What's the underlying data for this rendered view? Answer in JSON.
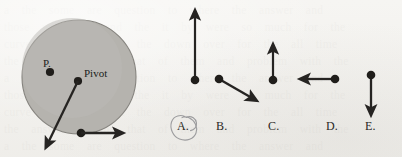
{
  "figure": {
    "type": "physics-rotating-disk-diagram",
    "background_color": "#f2f1ee",
    "ink_color": "#262422",
    "disk": {
      "label_pivot": "Pivot",
      "label_point_p": "P.",
      "fill_color": "#b5b3ae",
      "stroke_color": "#7e7c77",
      "center_x": 79,
      "center_y": 77,
      "radius": 57
    },
    "vectors": [
      {
        "name": "rim-velocity-arrow",
        "from_x": 81,
        "from_y": 133,
        "to_x": 122,
        "to_y": 133,
        "has_dot": true
      },
      {
        "name": "pivot-diagonal-arrow",
        "from_x": 78,
        "from_y": 81,
        "to_x": 47,
        "to_y": 146,
        "has_dot": true
      }
    ]
  },
  "options": [
    {
      "letter": "A.",
      "direction": "up",
      "circled": true,
      "dot_x": 195,
      "dot_y": 80,
      "tip_x": 195,
      "tip_y": 11,
      "label_x": 177,
      "label_y": 126
    },
    {
      "letter": "B.",
      "direction": "down-right",
      "circled": false,
      "dot_x": 219,
      "dot_y": 79,
      "tip_x": 256,
      "tip_y": 100,
      "label_x": 217,
      "label_y": 126
    },
    {
      "letter": "C.",
      "direction": "up",
      "circled": false,
      "dot_x": 273,
      "dot_y": 80,
      "tip_x": 273,
      "tip_y": 45,
      "label_x": 269,
      "label_y": 126
    },
    {
      "letter": "D.",
      "direction": "left",
      "circled": false,
      "dot_x": 335,
      "dot_y": 79,
      "tip_x": 300,
      "tip_y": 79,
      "label_x": 327,
      "label_y": 126
    },
    {
      "letter": "E.",
      "direction": "down",
      "circled": false,
      "dot_x": 371,
      "dot_y": 75,
      "tip_x": 371,
      "tip_y": 114,
      "label_x": 366,
      "label_y": 126
    }
  ],
  "annotation": {
    "name": "hand-drawn-circle-around-A",
    "color": "#9a9a9c",
    "target_letter": "A."
  },
  "bleed_text": "a  the  some  are  question  to  where  the  answer  and\nthose  with  has  and  the  it  by  were  so  much  for  the\ncurve  with  has  that  the  down  over  for  the  all  time\nthe  answer  to  the  that  of  them  and  problem  with  the"
}
